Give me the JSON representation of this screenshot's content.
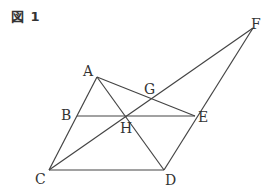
{
  "figure": {
    "title": "図 1",
    "line_color": "#444444",
    "label_color": "#333333"
  },
  "points": {
    "A": {
      "label": "A",
      "x": 97,
      "y": 77
    },
    "B": {
      "label": "B",
      "x": 77,
      "y": 116
    },
    "C": {
      "label": "C",
      "x": 49,
      "y": 170
    },
    "D": {
      "label": "D",
      "x": 164,
      "y": 170
    },
    "E": {
      "label": "E",
      "x": 195,
      "y": 116
    },
    "F": {
      "label": "F",
      "x": 253,
      "y": 28
    },
    "G": {
      "label": "G",
      "x": 151,
      "y": 100
    },
    "H": {
      "label": "H",
      "x": 125,
      "y": 116
    }
  },
  "segments": [
    [
      "A",
      "C"
    ],
    [
      "A",
      "D"
    ],
    [
      "A",
      "E"
    ],
    [
      "C",
      "D"
    ],
    [
      "D",
      "F"
    ],
    [
      "C",
      "F"
    ],
    [
      "B",
      "E"
    ]
  ]
}
